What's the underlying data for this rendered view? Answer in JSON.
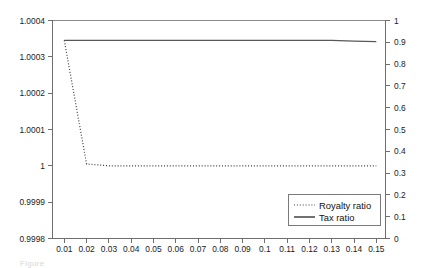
{
  "figure": {
    "background_color": "#ffffff",
    "caption_fragment": "Figure"
  },
  "axes": {
    "left": {
      "ticks": [
        "1.0004",
        "1.0003",
        "1.0002",
        "1.0001",
        "1",
        "0.9999",
        "0.9998"
      ],
      "min": 0.9998,
      "max": 1.0004
    },
    "right": {
      "ticks": [
        "1",
        "0.9",
        "0.8",
        "0.7",
        "0.6",
        "0.5",
        "0.4",
        "0.3",
        "0.2",
        "0.1",
        "0"
      ],
      "min": 0,
      "max": 1
    },
    "bottom": {
      "ticks": [
        "0.01",
        "0.02",
        "0.03",
        "0.04",
        "0.05",
        "0.06",
        "0.07",
        "0.08",
        "0.09",
        "0.1",
        "0.11",
        "0.12",
        "0.13",
        "0.14",
        "0.15"
      ]
    }
  },
  "legend": {
    "entries": [
      {
        "label": "Royalty ratio",
        "style": "dotted",
        "color": "#3b3b3b"
      },
      {
        "label": "Tax ratio",
        "style": "solid",
        "color": "#3f4346"
      }
    ]
  },
  "chart_data": {
    "type": "line",
    "title": "",
    "xlabel": "",
    "ylabel": "",
    "grid": false,
    "legend_position": "bottom-right",
    "x": [
      0.01,
      0.02,
      0.03,
      0.04,
      0.05,
      0.06,
      0.07,
      0.08,
      0.09,
      0.1,
      0.11,
      0.12,
      0.13,
      0.14,
      0.15
    ],
    "xlim": [
      0.01,
      0.15
    ],
    "axis_left": {
      "label": "",
      "ylim": [
        0.9998,
        1.0004
      ],
      "tick_values": [
        1.0004,
        1.0003,
        1.0002,
        1.0001,
        1.0,
        0.9999,
        0.9998
      ]
    },
    "axis_right": {
      "label": "",
      "ylim": [
        0,
        1
      ],
      "tick_values": [
        1,
        0.9,
        0.8,
        0.7,
        0.6,
        0.5,
        0.4,
        0.3,
        0.2,
        0.1,
        0
      ]
    },
    "series": [
      {
        "name": "Royalty ratio",
        "style": "dotted",
        "axis": "left",
        "values": [
          1.000345,
          1.000005,
          1.0,
          1.0,
          1.0,
          1.0,
          1.0,
          1.0,
          1.0,
          1.0,
          1.0,
          1.0,
          1.0,
          1.0,
          1.0
        ]
      },
      {
        "name": "Tax ratio",
        "style": "solid",
        "axis": "left",
        "values": [
          1.000345,
          1.000345,
          1.000345,
          1.000345,
          1.000345,
          1.000345,
          1.000345,
          1.000345,
          1.000345,
          1.000345,
          1.000345,
          1.000345,
          1.000345,
          1.000343,
          1.000342
        ]
      }
    ]
  }
}
